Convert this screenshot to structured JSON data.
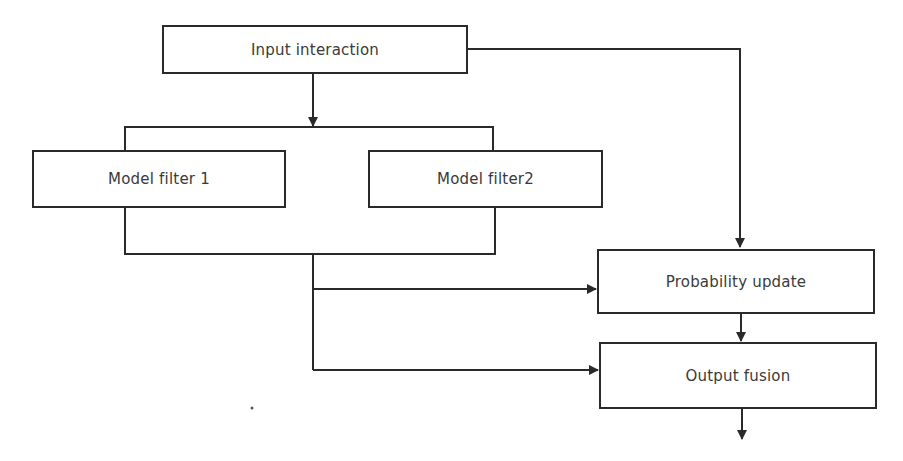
{
  "diagram": {
    "nodes": {
      "input": {
        "label": "Input interaction"
      },
      "filter1": {
        "label": "Model filter 1"
      },
      "filter2": {
        "label": "Model filter2"
      },
      "probability": {
        "label": "Probability update"
      },
      "fusion": {
        "label": "Output fusion"
      }
    },
    "edges": [
      {
        "from": "input",
        "to": "filter1,filter2"
      },
      {
        "from": "input",
        "to": "probability"
      },
      {
        "from": "filter1,filter2",
        "to": "probability"
      },
      {
        "from": "filter1,filter2",
        "to": "fusion"
      },
      {
        "from": "probability",
        "to": "fusion"
      },
      {
        "from": "fusion",
        "to": "output"
      }
    ],
    "colors": {
      "line": "#2a2a2a",
      "text": "#3a3a3a",
      "background": "#ffffff"
    }
  }
}
